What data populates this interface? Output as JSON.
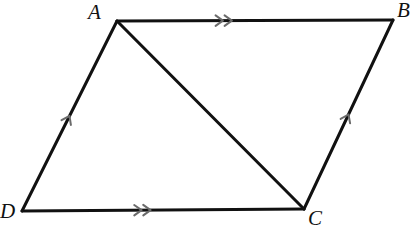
{
  "figure": {
    "name": "parallelogram-abcd-with-diagonal",
    "type": "geometry-diagram",
    "canvas": {
      "width": 412,
      "height": 247,
      "background": "#ffffff"
    },
    "style": {
      "edge_color": "#111111",
      "edge_width": 3,
      "tick_color": "#6b6b6b",
      "tick_width": 2,
      "label_color": "#111111",
      "label_font_size": 21
    },
    "vertices": [
      {
        "id": "A",
        "label": "A",
        "x": 117,
        "y": 21,
        "label_x": 88,
        "label_y": 2
      },
      {
        "id": "B",
        "label": "B",
        "x": 393,
        "y": 20,
        "label_x": 397,
        "label_y": 0
      },
      {
        "id": "C",
        "label": "C",
        "x": 304,
        "y": 209,
        "label_x": 308,
        "label_y": 208
      },
      {
        "id": "D",
        "label": "D",
        "x": 22,
        "y": 211,
        "label_x": 0,
        "label_y": 201
      }
    ],
    "edges": [
      {
        "id": "AB",
        "from": "A",
        "to": "B",
        "ticks": 2,
        "tick_at": 0.4,
        "role": "side-top"
      },
      {
        "id": "BC",
        "from": "C",
        "to": "B",
        "ticks": 1,
        "tick_at": 0.5,
        "role": "side-right"
      },
      {
        "id": "DC",
        "from": "D",
        "to": "C",
        "ticks": 2,
        "tick_at": 0.44,
        "role": "side-bottom"
      },
      {
        "id": "DA",
        "from": "D",
        "to": "A",
        "ticks": 1,
        "tick_at": 0.5,
        "role": "side-left"
      },
      {
        "id": "AC",
        "from": "A",
        "to": "C",
        "ticks": 0,
        "tick_at": 0.5,
        "role": "diagonal"
      }
    ]
  }
}
